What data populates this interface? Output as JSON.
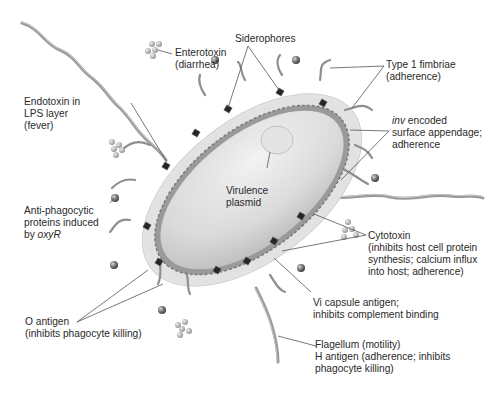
{
  "diagram": {
    "type": "labeled-illustration",
    "colors": {
      "background": "#ffffff",
      "cell_body": "#dcdcdc",
      "capsule": "#ececec",
      "membrane": "#8a8a8a",
      "flagella": "#9a9a9a",
      "siderophore": "#222222",
      "leader_line": "#555555",
      "text": "#2a2a2a"
    },
    "labels": {
      "enterotoxin": {
        "lines": [
          "Enterotoxin",
          "(diarrhea)"
        ]
      },
      "siderophores": {
        "lines": [
          "Siderophores"
        ]
      },
      "type1_fimbriae": {
        "lines": [
          "Type 1 fimbriae",
          "(adherence)"
        ]
      },
      "endotoxin": {
        "lines": [
          "Endotoxin in",
          "LPS layer",
          "(fever)"
        ]
      },
      "inv_appendage": {
        "italic_prefix": "inv",
        "lines": [
          " encoded",
          "surface appendage;",
          "adherence"
        ]
      },
      "virulence_plasmid": {
        "lines": [
          "Virulence",
          "plasmid"
        ]
      },
      "anti_phagocytic": {
        "lines": [
          "Anti-phagocytic",
          "proteins induced"
        ],
        "last_prefix": "by ",
        "last_italic": "oxyR"
      },
      "cytotoxin": {
        "lines": [
          "Cytotoxin",
          "(inhibits host cell protein",
          "synthesis; calcium influx",
          "into host; adherence)"
        ]
      },
      "vi_capsule": {
        "lines": [
          "Vi capsule antigen;",
          "inhibits complement binding"
        ]
      },
      "o_antigen": {
        "lines": [
          "O antigen",
          "(inhibits phagocyte killing)"
        ]
      },
      "flagellum": {
        "lines": [
          "Flagellum (motility)",
          "H antigen (adherence; inhibits",
          "phagocyte killing)"
        ]
      }
    }
  }
}
